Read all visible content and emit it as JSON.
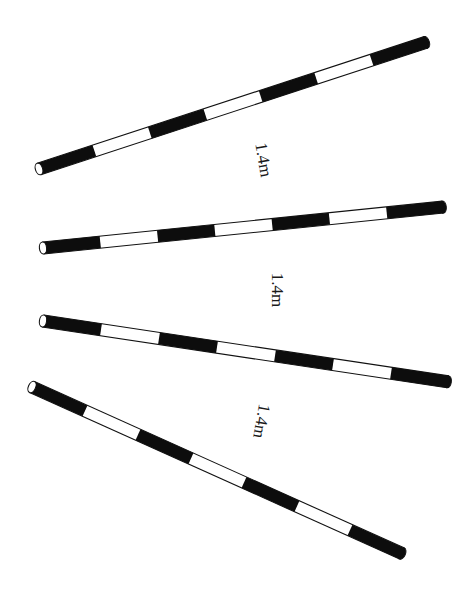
{
  "figure": {
    "colors": {
      "dark": "#0d0d0d",
      "light": "#ffffff",
      "outline": "#111111",
      "background": "#ffffff"
    },
    "poles": [
      {
        "id": "pole-1",
        "segments": 7,
        "pattern": [
          "dark",
          "light",
          "dark",
          "light",
          "dark",
          "light",
          "dark"
        ]
      },
      {
        "id": "pole-2",
        "segments": 7,
        "pattern": [
          "dark",
          "light",
          "dark",
          "light",
          "dark",
          "light",
          "dark"
        ]
      },
      {
        "id": "pole-3",
        "segments": 7,
        "pattern": [
          "dark",
          "light",
          "dark",
          "light",
          "dark",
          "light",
          "dark"
        ]
      },
      {
        "id": "pole-4",
        "segments": 7,
        "pattern": [
          "dark",
          "light",
          "dark",
          "light",
          "dark",
          "light",
          "dark"
        ]
      }
    ],
    "spacing_labels": [
      {
        "text": "1.4m",
        "between": [
          "pole-1",
          "pole-2"
        ]
      },
      {
        "text": "1.4m",
        "between": [
          "pole-2",
          "pole-3"
        ]
      },
      {
        "text": "1.4m",
        "between": [
          "pole-3",
          "pole-4"
        ]
      }
    ]
  }
}
